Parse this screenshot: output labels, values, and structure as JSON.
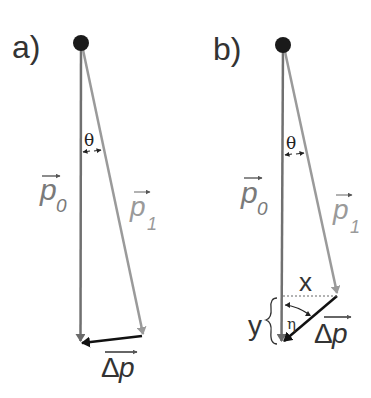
{
  "panels": [
    {
      "id": "a",
      "label": "a)",
      "theta": "θ",
      "p0": {
        "base": "p",
        "sub": "0"
      },
      "p1": {
        "base": "p",
        "sub": "1"
      },
      "dp": {
        "delta": "Δ",
        "base": "p"
      }
    },
    {
      "id": "b",
      "label": "b)",
      "theta": "θ",
      "p0": {
        "base": "p",
        "sub": "0"
      },
      "p1": {
        "base": "p",
        "sub": "1"
      },
      "dp": {
        "delta": "Δ",
        "base": "p"
      },
      "x_label": "x",
      "y_label": "y",
      "eta": "η"
    }
  ],
  "colors": {
    "p0": "#707070",
    "p1": "#9a9a9a",
    "dp": "#111111",
    "pivot": "#1a1a1a",
    "text_dark": "#333333",
    "text_gray": "#8a8a8a"
  }
}
